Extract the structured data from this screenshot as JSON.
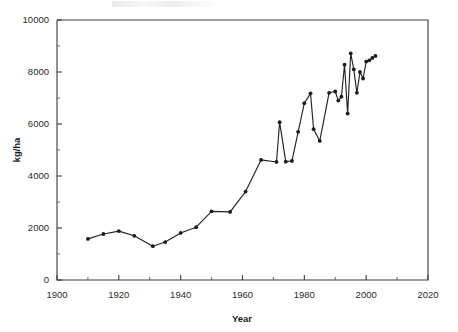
{
  "chart_data": {
    "type": "line",
    "title": "",
    "xlabel": "Year",
    "ylabel": "kg/ha",
    "xlim": [
      1900,
      2020
    ],
    "ylim": [
      0,
      10000
    ],
    "grid": false,
    "legend": null,
    "x_ticks": [
      1900,
      1920,
      1940,
      1960,
      1980,
      2000,
      2020
    ],
    "x_tick_labels": [
      "1900",
      "1920",
      "1940",
      "1960",
      "1980",
      "2000",
      "2020"
    ],
    "x_minor_ticks": [
      1910,
      1930,
      1950,
      1970,
      1990,
      2010
    ],
    "y_ticks": [
      0,
      2000,
      4000,
      6000,
      8000,
      10000
    ],
    "y_tick_labels": [
      "0",
      "2000",
      "4000",
      "6000",
      "8000",
      "10000"
    ],
    "y_minor_ticks": [
      1000,
      3000,
      5000,
      7000,
      9000
    ],
    "marker": "filled-circle",
    "series": [
      {
        "name": "yield",
        "x": [
          1910,
          1915,
          1920,
          1925,
          1931,
          1935,
          1940,
          1945,
          1950,
          1956,
          1961,
          1966,
          1971,
          1972,
          1974,
          1976,
          1978,
          1980,
          1982,
          1983,
          1985,
          1988,
          1990,
          1991,
          1992,
          1993,
          1994,
          1995,
          1996,
          1997,
          1998,
          1999,
          2000,
          2001,
          2002,
          2003
        ],
        "y": [
          1580,
          1770,
          1880,
          1700,
          1300,
          1460,
          1810,
          2030,
          2640,
          2620,
          3400,
          4620,
          4540,
          6070,
          4550,
          4580,
          5700,
          6800,
          7180,
          5800,
          5350,
          7200,
          7250,
          6900,
          7050,
          8280,
          6400,
          8720,
          8100,
          7200,
          8000,
          7750,
          8400,
          8450,
          8540,
          8620
        ]
      }
    ]
  },
  "axes": {
    "ylabel_text": "kg/ha",
    "xlabel_text": "Year"
  }
}
